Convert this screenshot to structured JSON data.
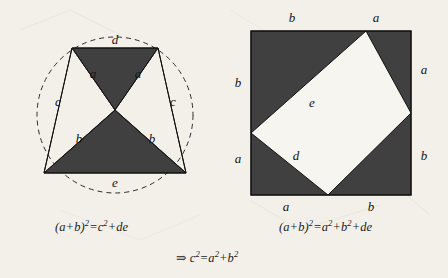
{
  "document": {
    "kind": "geometry-proof-figure",
    "subject": "Pythagorean theorem proof",
    "background_color": "#f3f0ea",
    "fill_color": "#404040",
    "line_color": "#111111"
  },
  "figure_left": {
    "name": "circle-trapezoid-figure",
    "description": "Circle with inscribed isosceles trapezoid divided into shaded triangles",
    "circle": {
      "cx": 115,
      "cy": 115,
      "r": 78,
      "stroke_style": "dashed"
    },
    "labels": [
      {
        "id": "d-top",
        "text": "d",
        "x": 115,
        "y": 44
      },
      {
        "id": "a-left",
        "text": "a",
        "x": 93,
        "y": 78
      },
      {
        "id": "a-right",
        "text": "a",
        "x": 138,
        "y": 78
      },
      {
        "id": "c-left",
        "text": "c",
        "x": 58,
        "y": 106
      },
      {
        "id": "c-right",
        "text": "c",
        "x": 173,
        "y": 106
      },
      {
        "id": "b-left",
        "text": "b",
        "x": 79,
        "y": 143
      },
      {
        "id": "b-right",
        "text": "b",
        "x": 152,
        "y": 143
      },
      {
        "id": "e-bottom",
        "text": "e",
        "x": 115,
        "y": 187
      }
    ],
    "caption": "(a+b)2=c2+de",
    "caption_parts": {
      "lead": "(a+b)",
      "exp1": "2",
      "eq": "=c",
      "exp2": "2",
      "tail": "+de"
    }
  },
  "figure_right": {
    "name": "square-tilted-square-figure",
    "description": "Large square containing a tilted inscribed square, four shaded right triangles in the corners",
    "outer_square": {
      "x": 27,
      "y": 31,
      "width": 160,
      "height": 164
    },
    "labels": [
      {
        "id": "b-top",
        "text": "b",
        "x": 68,
        "y": 22
      },
      {
        "id": "a-top",
        "text": "a",
        "x": 152,
        "y": 22
      },
      {
        "id": "a-right",
        "text": "a",
        "x": 200,
        "y": 70
      },
      {
        "id": "b-right",
        "text": "b",
        "x": 200,
        "y": 160
      },
      {
        "id": "b-left",
        "text": "b",
        "x": 14,
        "y": 83
      },
      {
        "id": "a-left",
        "text": "a",
        "x": 14,
        "y": 163
      },
      {
        "id": "a-bottom",
        "text": "a",
        "x": 62,
        "y": 209
      },
      {
        "id": "b-bottom",
        "text": "b",
        "x": 147,
        "y": 209
      },
      {
        "id": "e-inner",
        "text": "e",
        "x": 88,
        "y": 105
      },
      {
        "id": "d-inner",
        "text": "d",
        "x": 72,
        "y": 158
      }
    ],
    "caption": "(a+b)2=a2+b2+de",
    "caption_parts": {
      "lead": "(a+b)",
      "exp1": "2",
      "eq": "=a",
      "exp2": "2",
      "mid": "+b",
      "exp3": "2",
      "tail": "+de"
    }
  },
  "conclusion": {
    "name": "conclusion-line",
    "arrow": "⇒",
    "text": "c2=a2+b2",
    "parts": {
      "lead": "c",
      "exp1": "2",
      "eq": "=a",
      "exp2": "2",
      "mid": "+b",
      "exp3": "2"
    }
  }
}
